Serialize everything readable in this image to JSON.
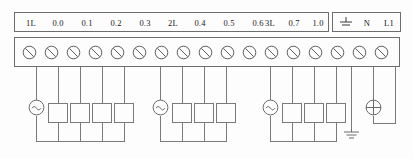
{
  "diagram": {
    "label_row": {
      "main_groups": [
        {
          "group": "1L",
          "channels": [
            "0.0",
            "0.1",
            "0.2",
            "0.3"
          ]
        },
        {
          "group": "2L",
          "channels": [
            "0.4",
            "0.5",
            "0.6"
          ]
        },
        {
          "group": "3L",
          "channels": [
            "0.7",
            "1.0",
            "1.1"
          ]
        }
      ],
      "power_box": {
        "ground_symbol": "earth-ground",
        "neutral": "N",
        "line": "L1"
      }
    },
    "terminal_strip": {
      "terminal_count": 17,
      "terminal_symbol": "slotted-screw"
    },
    "circuit": {
      "groups": [
        {
          "name": "1L",
          "source": {
            "symbol": "ac-source",
            "glyph": "~"
          },
          "load_count": 4
        },
        {
          "name": "2L",
          "source": {
            "symbol": "ac-source",
            "glyph": "~"
          },
          "load_count": 3
        },
        {
          "name": "3L",
          "source": {
            "symbol": "ac-source",
            "glyph": "~"
          },
          "load_count": 3
        }
      ],
      "earth": {
        "symbol": "earth-ground"
      },
      "lamp": {
        "symbol": "lamp-cross"
      }
    },
    "colors": {
      "line": "#7a7a7a",
      "border": "#6d6d6d",
      "text": "#1a1a1a",
      "background": "#fdfdfd"
    }
  }
}
